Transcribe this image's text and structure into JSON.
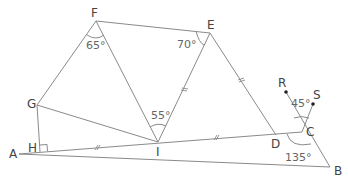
{
  "figure": {
    "type": "geometry-diagram",
    "points": {
      "A": {
        "label": "A",
        "x": 19,
        "y": 154
      },
      "H": {
        "label": "H",
        "x": 40,
        "y": 151
      },
      "G": {
        "label": "G",
        "x": 37,
        "y": 105
      },
      "F": {
        "label": "F",
        "x": 96,
        "y": 21
      },
      "E": {
        "label": "E",
        "x": 210,
        "y": 33
      },
      "I": {
        "label": "I",
        "x": 158,
        "y": 142
      },
      "D": {
        "label": "D",
        "x": 276,
        "y": 135
      },
      "C": {
        "label": "C",
        "x": 302,
        "y": 132
      },
      "B": {
        "label": "B",
        "x": 330,
        "y": 167
      },
      "R": {
        "label": "R",
        "x": 286,
        "y": 92
      },
      "S": {
        "label": "S",
        "x": 313,
        "y": 104
      }
    },
    "angles": {
      "F": "65°",
      "E": "70°",
      "I": "55°",
      "RCS": "45°",
      "DCB": "135°"
    },
    "right_angle_at": "H",
    "equal_segments": [
      "AI",
      "ID",
      "IE",
      "ED"
    ]
  }
}
